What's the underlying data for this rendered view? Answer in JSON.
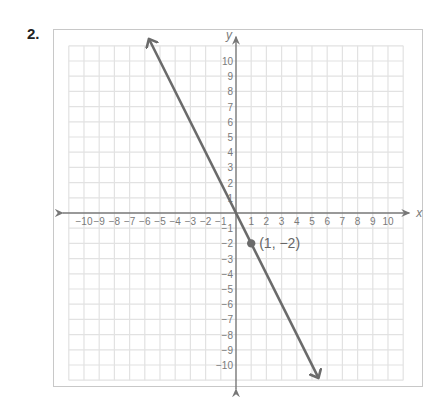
{
  "problem": {
    "number": "2."
  },
  "colors": {
    "grid": "#e2e2e2",
    "axis": "#777777",
    "line": "#6b6b6b",
    "point": "#6b6b6b",
    "frame": "#c8c8c8",
    "text": "#7a7a7a"
  },
  "chart_data": {
    "type": "line",
    "title": "",
    "xlabel": "x",
    "ylabel": "y",
    "xlim": [
      -11,
      11
    ],
    "ylim": [
      -11,
      11
    ],
    "grid": true,
    "x_ticks": [
      -10,
      -9,
      -8,
      -7,
      -6,
      -5,
      -4,
      -3,
      -2,
      -1,
      1,
      2,
      3,
      4,
      5,
      6,
      7,
      8,
      9,
      10
    ],
    "y_ticks": [
      10,
      9,
      8,
      7,
      6,
      5,
      4,
      3,
      2,
      1,
      -1,
      -2,
      -3,
      -4,
      -5,
      -6,
      -7,
      -8,
      -9,
      -10
    ],
    "x_tick_labels": [
      "−10",
      "−9",
      "−8",
      "−7",
      "−6",
      "−5",
      "−4",
      "−3",
      "−2",
      "−1",
      "1",
      "2",
      "3",
      "4",
      "5",
      "6",
      "7",
      "8",
      "9",
      "10"
    ],
    "y_tick_labels": [
      "10",
      "9",
      "8",
      "7",
      "6",
      "5",
      "4",
      "3",
      "2",
      "1",
      "−1",
      "−2",
      "−3",
      "−4",
      "−5",
      "−6",
      "−7",
      "−8",
      "−9",
      "−10"
    ],
    "series": [
      {
        "name": "y = -2x",
        "slope": -2,
        "intercept": 0,
        "x": [
          -5.7,
          5.4
        ],
        "y": [
          11.4,
          -10.8
        ],
        "arrows": "both"
      }
    ],
    "points": [
      {
        "x": 1,
        "y": -2,
        "label": "(1, −2)"
      }
    ]
  }
}
